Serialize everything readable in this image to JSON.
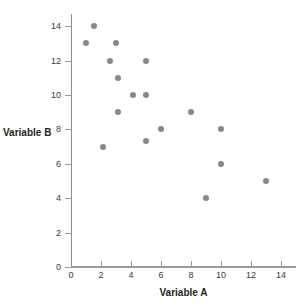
{
  "chart_data": {
    "type": "scatter",
    "title": "",
    "xlabel": "Variable A",
    "ylabel": "Variable B",
    "xlim": [
      0,
      15
    ],
    "ylim": [
      0,
      15
    ],
    "xticks": [
      0,
      2,
      4,
      6,
      8,
      10,
      12,
      14
    ],
    "yticks": [
      0,
      2,
      4,
      6,
      8,
      10,
      12,
      14
    ],
    "xtick_labels": [
      "0",
      "2",
      "4",
      "6",
      "8",
      "10",
      "12",
      "14"
    ],
    "ytick_labels": [
      "0",
      "2",
      "4",
      "6",
      "8",
      "10",
      "12",
      "14"
    ],
    "grid": false,
    "legend": false,
    "series": [
      {
        "name": "observations",
        "marker": "circle",
        "color": "#87878d",
        "points": [
          {
            "x": 1.5,
            "y": 14.0
          },
          {
            "x": 1.0,
            "y": 13.0
          },
          {
            "x": 3.0,
            "y": 13.0
          },
          {
            "x": 2.6,
            "y": 12.0
          },
          {
            "x": 5.0,
            "y": 12.0
          },
          {
            "x": 3.1,
            "y": 11.0
          },
          {
            "x": 4.1,
            "y": 10.0
          },
          {
            "x": 5.0,
            "y": 10.0
          },
          {
            "x": 3.1,
            "y": 9.0
          },
          {
            "x": 8.0,
            "y": 9.0
          },
          {
            "x": 6.0,
            "y": 8.0
          },
          {
            "x": 10.0,
            "y": 8.0
          },
          {
            "x": 5.0,
            "y": 7.3
          },
          {
            "x": 2.1,
            "y": 7.0
          },
          {
            "x": 10.0,
            "y": 6.0
          },
          {
            "x": 13.0,
            "y": 5.0
          },
          {
            "x": 9.0,
            "y": 4.0
          }
        ]
      }
    ],
    "colors": {
      "marker": "#87878d",
      "axis": "#9a9a9a",
      "text": "#231f20",
      "background": "#ffffff"
    }
  }
}
